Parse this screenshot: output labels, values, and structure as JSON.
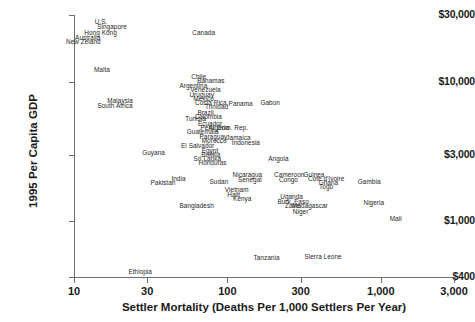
{
  "chart_data": {
    "type": "scatter",
    "title": "",
    "xlabel": "Settler Mortality (Deaths Per 1,000 Settlers Per Year)",
    "ylabel": "1995 Per Capita GDP",
    "xscale": "log",
    "yscale": "log",
    "xlim": [
      10,
      3000
    ],
    "ylim": [
      400,
      30000
    ],
    "grid": false,
    "legend": "none",
    "marker_style": "text-label-only",
    "xticks": [
      {
        "value": 10,
        "label": "10"
      },
      {
        "value": 30,
        "label": "30"
      },
      {
        "value": 100,
        "label": "100"
      },
      {
        "value": 300,
        "label": "300"
      },
      {
        "value": 1000,
        "label": "1,000"
      },
      {
        "value": 3000,
        "label": "3,000"
      }
    ],
    "yticks": [
      {
        "value": 30000,
        "label": "$30,000"
      },
      {
        "value": 10000,
        "label": "$10,000"
      },
      {
        "value": 3000,
        "label": "$3,000"
      },
      {
        "value": 1000,
        "label": "$1,000"
      },
      {
        "value": 400,
        "label": "$400"
      }
    ],
    "points": [
      {
        "label": "U.S.",
        "x": 15,
        "y": 27000
      },
      {
        "label": "Singapore",
        "x": 17.7,
        "y": 25000
      },
      {
        "label": "Hong Kong",
        "x": 14.9,
        "y": 22500
      },
      {
        "label": "Australia",
        "x": 12.3,
        "y": 20800
      },
      {
        "label": "New Zeland",
        "x": 11.5,
        "y": 19400
      },
      {
        "label": "Canada",
        "x": 70,
        "y": 22500
      },
      {
        "label": "Malta",
        "x": 15.2,
        "y": 12400
      },
      {
        "label": "Chile",
        "x": 65,
        "y": 11000
      },
      {
        "label": "Bahamas",
        "x": 78,
        "y": 10200
      },
      {
        "label": "Argentina",
        "x": 60,
        "y": 9500
      },
      {
        "label": "Venezuela",
        "x": 72,
        "y": 8800
      },
      {
        "label": "Uruguay",
        "x": 68,
        "y": 8200
      },
      {
        "label": "Mexico",
        "x": 70,
        "y": 7700
      },
      {
        "label": "Malaysia",
        "x": 20,
        "y": 7400
      },
      {
        "label": "Costa Rica",
        "x": 78,
        "y": 7150
      },
      {
        "label": "South Africa",
        "x": 18.5,
        "y": 6850
      },
      {
        "label": "Trinidad",
        "x": 85,
        "y": 6700
      },
      {
        "label": "Panama",
        "x": 122,
        "y": 7000
      },
      {
        "label": "Gabon",
        "x": 190,
        "y": 7100
      },
      {
        "label": "Brazil",
        "x": 72,
        "y": 6050
      },
      {
        "label": "Colombia",
        "x": 75,
        "y": 5700
      },
      {
        "label": "Tunisia",
        "x": 62,
        "y": 5500
      },
      {
        "label": "Ecuador",
        "x": 77,
        "y": 5100
      },
      {
        "label": "Peru",
        "x": 74,
        "y": 4700
      },
      {
        "label": "Algeria",
        "x": 88,
        "y": 4700
      },
      {
        "label": "Dom. Rep.",
        "x": 108,
        "y": 4700
      },
      {
        "label": "Guatemala",
        "x": 69,
        "y": 4400
      },
      {
        "label": "Paraguay",
        "x": 81,
        "y": 4100
      },
      {
        "label": "Jamaica",
        "x": 118,
        "y": 4050
      },
      {
        "label": "Morocco",
        "x": 82,
        "y": 3800
      },
      {
        "label": "Indonesia",
        "x": 132,
        "y": 3700
      },
      {
        "label": "El Salvador",
        "x": 64,
        "y": 3500
      },
      {
        "label": "Egypt",
        "x": 77,
        "y": 3250
      },
      {
        "label": "Guyana",
        "x": 33,
        "y": 3150
      },
      {
        "label": "Bolivia",
        "x": 78,
        "y": 3050
      },
      {
        "label": "Sri Lanka",
        "x": 74,
        "y": 2850
      },
      {
        "label": "Angola",
        "x": 215,
        "y": 2850
      },
      {
        "label": "Honduras",
        "x": 80,
        "y": 2650
      },
      {
        "label": "Nicaragua",
        "x": 135,
        "y": 2200
      },
      {
        "label": "Cameroon",
        "x": 253,
        "y": 2200
      },
      {
        "label": "Guinea",
        "x": 367,
        "y": 2200
      },
      {
        "label": "Cote d'Ivoire",
        "x": 440,
        "y": 2050
      },
      {
        "label": "India",
        "x": 48,
        "y": 2050
      },
      {
        "label": "Senegal",
        "x": 140,
        "y": 2000
      },
      {
        "label": "Congo",
        "x": 250,
        "y": 2000
      },
      {
        "label": "Ghana",
        "x": 455,
        "y": 1900
      },
      {
        "label": "Sudan",
        "x": 88,
        "y": 1950
      },
      {
        "label": "Pakistan",
        "x": 38,
        "y": 1900
      },
      {
        "label": "Togo",
        "x": 440,
        "y": 1800
      },
      {
        "label": "Gambia",
        "x": 840,
        "y": 1950
      },
      {
        "label": "Vietnam",
        "x": 115,
        "y": 1700
      },
      {
        "label": "Haiti",
        "x": 110,
        "y": 1580
      },
      {
        "label": "Uganda",
        "x": 262,
        "y": 1520
      },
      {
        "label": "Kenya",
        "x": 125,
        "y": 1470
      },
      {
        "label": "Burk. Faso",
        "x": 268,
        "y": 1400
      },
      {
        "label": "Nigeria",
        "x": 900,
        "y": 1380
      },
      {
        "label": "Bangladesh",
        "x": 63,
        "y": 1320
      },
      {
        "label": "Zaire",
        "x": 265,
        "y": 1310
      },
      {
        "label": "Madagascar",
        "x": 345,
        "y": 1300
      },
      {
        "label": "Niger",
        "x": 300,
        "y": 1180
      },
      {
        "label": "Mali",
        "x": 1250,
        "y": 1060
      },
      {
        "label": "Tanzania",
        "x": 180,
        "y": 560
      },
      {
        "label": "Sierra Leone",
        "x": 420,
        "y": 570
      },
      {
        "label": "Ethiopia",
        "x": 27,
        "y": 440
      }
    ]
  }
}
